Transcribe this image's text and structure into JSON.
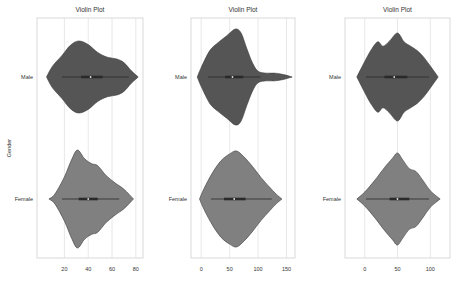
{
  "chart_data": [
    {
      "type": "violin",
      "title": "Violin Plot",
      "xlabel": "",
      "ylabel": "Gender",
      "categories": [
        "Male",
        "Female"
      ],
      "xlim": [
        -3,
        86
      ],
      "xticks": [
        20,
        40,
        60,
        80
      ],
      "grid": true,
      "series": [
        {
          "name": "Male",
          "color": "#555555",
          "density": [
            [
              5,
              0
            ],
            [
              10,
              0.3
            ],
            [
              18,
              0.6
            ],
            [
              25,
              0.88
            ],
            [
              32,
              1.0
            ],
            [
              40,
              0.9
            ],
            [
              48,
              0.68
            ],
            [
              56,
              0.55
            ],
            [
              64,
              0.5
            ],
            [
              70,
              0.4
            ],
            [
              76,
              0.18
            ],
            [
              82,
              0
            ]
          ],
          "box": {
            "q1": 34,
            "median": 42,
            "q3": 52,
            "whisker_low": 18,
            "whisker_high": 74
          }
        },
        {
          "name": "Female",
          "color": "#808080",
          "density": [
            [
              7,
              0
            ],
            [
              12,
              0.1
            ],
            [
              20,
              0.45
            ],
            [
              26,
              0.8
            ],
            [
              31,
              1.0
            ],
            [
              37,
              0.82
            ],
            [
              43,
              0.72
            ],
            [
              48,
              0.68
            ],
            [
              55,
              0.48
            ],
            [
              63,
              0.32
            ],
            [
              70,
              0.2
            ],
            [
              78,
              0
            ]
          ],
          "box": {
            "q1": 32,
            "median": 40,
            "q3": 48,
            "whisker_low": 18,
            "whisker_high": 66
          }
        }
      ]
    },
    {
      "type": "violin",
      "title": "Violin Plot",
      "xlabel": "",
      "ylabel": "",
      "categories": [
        "Male",
        "Female"
      ],
      "xlim": [
        -18,
        165
      ],
      "xticks": [
        0,
        50,
        100,
        150
      ],
      "grid": true,
      "series": [
        {
          "name": "Male",
          "color": "#555555",
          "density": [
            [
              -7,
              0
            ],
            [
              0,
              0.2
            ],
            [
              15,
              0.55
            ],
            [
              30,
              0.72
            ],
            [
              45,
              0.86
            ],
            [
              60,
              1.0
            ],
            [
              70,
              0.92
            ],
            [
              80,
              0.6
            ],
            [
              90,
              0.3
            ],
            [
              100,
              0.12
            ],
            [
              115,
              0.08
            ],
            [
              130,
              0.08
            ],
            [
              145,
              0.05
            ],
            [
              160,
              0
            ]
          ],
          "box": {
            "q1": 42,
            "median": 55,
            "q3": 74,
            "whisker_low": 12,
            "whisker_high": 104
          }
        },
        {
          "name": "Female",
          "color": "#808080",
          "density": [
            [
              -3,
              0
            ],
            [
              5,
              0.22
            ],
            [
              20,
              0.55
            ],
            [
              35,
              0.8
            ],
            [
              50,
              0.94
            ],
            [
              62,
              1.0
            ],
            [
              75,
              0.88
            ],
            [
              90,
              0.68
            ],
            [
              105,
              0.45
            ],
            [
              120,
              0.25
            ],
            [
              132,
              0.1
            ],
            [
              142,
              0
            ]
          ],
          "box": {
            "q1": 40,
            "median": 58,
            "q3": 78,
            "whisker_low": 17,
            "whisker_high": 124
          }
        }
      ]
    },
    {
      "type": "violin",
      "title": "Violin Plot",
      "xlabel": "",
      "ylabel": "",
      "categories": [
        "Male",
        "Female"
      ],
      "xlim": [
        -30,
        130
      ],
      "xticks": [
        0,
        50,
        100
      ],
      "grid": true,
      "series": [
        {
          "name": "Male",
          "color": "#555555",
          "density": [
            [
              -12,
              0
            ],
            [
              0,
              0.35
            ],
            [
              10,
              0.62
            ],
            [
              20,
              0.8
            ],
            [
              28,
              0.7
            ],
            [
              38,
              0.82
            ],
            [
              50,
              1.0
            ],
            [
              60,
              0.8
            ],
            [
              70,
              0.7
            ],
            [
              80,
              0.6
            ],
            [
              90,
              0.45
            ],
            [
              100,
              0.25
            ],
            [
              112,
              0
            ]
          ],
          "box": {
            "q1": 30,
            "median": 45,
            "q3": 65,
            "whisker_low": 2,
            "whisker_high": 98
          }
        },
        {
          "name": "Female",
          "color": "#808080",
          "density": [
            [
              -12,
              0
            ],
            [
              0,
              0.15
            ],
            [
              15,
              0.4
            ],
            [
              30,
              0.68
            ],
            [
              42,
              0.88
            ],
            [
              50,
              1.0
            ],
            [
              58,
              0.85
            ],
            [
              68,
              0.66
            ],
            [
              78,
              0.6
            ],
            [
              88,
              0.42
            ],
            [
              100,
              0.18
            ],
            [
              115,
              0
            ]
          ],
          "box": {
            "q1": 38,
            "median": 50,
            "q3": 68,
            "whisker_low": 2,
            "whisker_high": 98
          }
        }
      ]
    }
  ]
}
